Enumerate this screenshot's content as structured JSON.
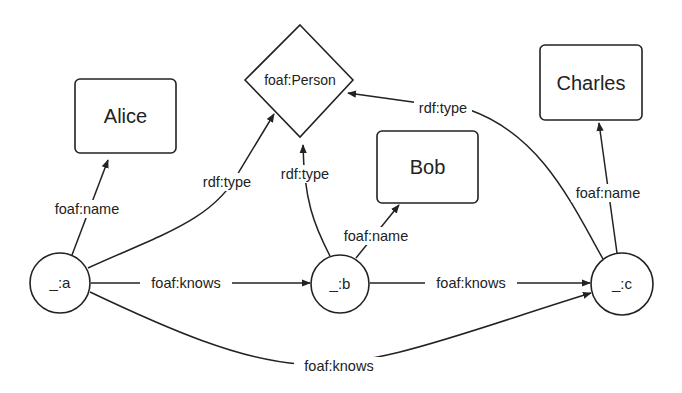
{
  "diagram": {
    "title": "",
    "nodes": [
      {
        "id": "alice",
        "label": "Alice",
        "shape": "rounded-rect"
      },
      {
        "id": "person",
        "label": "foaf:Person",
        "shape": "diamond"
      },
      {
        "id": "bob",
        "label": "Bob",
        "shape": "rounded-rect"
      },
      {
        "id": "charles",
        "label": "Charles",
        "shape": "rounded-rect"
      },
      {
        "id": "a",
        "label": "_:a",
        "shape": "circle"
      },
      {
        "id": "b",
        "label": "_:b",
        "shape": "circle"
      },
      {
        "id": "c",
        "label": "_:c",
        "shape": "circle"
      }
    ],
    "edges": [
      {
        "from": "a",
        "to": "alice",
        "label": "foaf:name"
      },
      {
        "from": "a",
        "to": "person",
        "label": "rdf:type"
      },
      {
        "from": "b",
        "to": "person",
        "label": "rdf:type"
      },
      {
        "from": "c",
        "to": "person",
        "label": "rdf:type"
      },
      {
        "from": "b",
        "to": "bob",
        "label": "foaf:name"
      },
      {
        "from": "c",
        "to": "charles",
        "label": "foaf:name"
      },
      {
        "from": "a",
        "to": "b",
        "label": "foaf:knows"
      },
      {
        "from": "b",
        "to": "c",
        "label": "foaf:knows"
      },
      {
        "from": "a",
        "to": "c",
        "label": "foaf:knows"
      }
    ]
  }
}
